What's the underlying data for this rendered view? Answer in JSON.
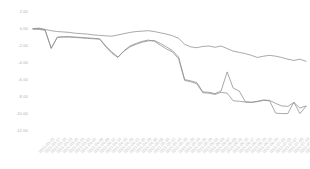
{
  "chart_data": {
    "type": "line",
    "title": "",
    "subtitle": "",
    "xlabel": "",
    "ylabel": "",
    "grid": false,
    "legend": "none",
    "line_color": "#8c8c8c",
    "tick_color": "#b8b8b8",
    "background": "#ffffff",
    "ylim": [
      -12.0,
      2.0
    ],
    "yticks": [
      2.0,
      0.0,
      -2.0,
      -4.0,
      -6.0,
      -8.0,
      -10.0,
      -12.0
    ],
    "ytick_labels": [
      "2.00",
      "0.00",
      "-2.00",
      "-4.00",
      "-6.00",
      "-8.00",
      "-10.00",
      "-12.00"
    ],
    "x": [
      "2021-03-15",
      "2021-03-17",
      "2021-03-19",
      "2021-03-23",
      "2021-03-25",
      "2021-03-29",
      "2021-03-31",
      "2021-04-02",
      "2021-04-06",
      "2021-04-08",
      "2021-04-12",
      "2021-04-14",
      "2021-04-16",
      "2021-04-20",
      "2021-04-22",
      "2021-04-26",
      "2021-04-28",
      "2021-04-30",
      "2021-05-06",
      "2021-05-10",
      "2021-05-12",
      "2021-05-14",
      "2021-05-18",
      "2021-05-20",
      "2021-05-24",
      "2021-05-26",
      "2021-05-28",
      "2021-06-01",
      "2021-06-03",
      "2021-06-07",
      "2021-06-09",
      "2021-06-11",
      "2021-06-15",
      "2021-06-17",
      "2021-06-21",
      "2021-06-23",
      "2021-06-25",
      "2021-06-29",
      "2021-07-01",
      "2021-07-05",
      "2021-07-07",
      "2021-07-09",
      "2021-07-13",
      "2021-07-15",
      "2021-07-19",
      "2021-07-21"
    ],
    "xtick_labels": [
      "2021-03-15",
      "2021-03-17",
      "2021-03-19",
      "2021-03-23",
      "2021-03-25",
      "2021-03-29",
      "2021-03-31",
      "2021-04-02",
      "2021-04-06",
      "2021-04-08",
      "2021-04-12",
      "2021-04-14",
      "2021-04-16",
      "2021-04-20",
      "2021-04-22",
      "2021-04-26",
      "2021-04-28",
      "2021-04-30",
      "2021-05-06",
      "2021-05-10",
      "2021-05-12",
      "2021-05-14",
      "2021-05-18",
      "2021-05-20",
      "2021-05-24",
      "2021-05-26",
      "2021-05-28",
      "2021-06-01",
      "2021-06-03",
      "2021-06-07",
      "2021-06-09",
      "2021-06-11",
      "2021-06-15",
      "2021-06-17",
      "2021-06-21",
      "2021-06-23",
      "2021-06-25",
      "2021-06-29",
      "2021-07-01",
      "2021-07-05",
      "2021-07-07",
      "2021-07-09",
      "2021-07-13",
      "2021-07-15",
      "2021-07-19",
      "2021-07-21"
    ],
    "series": [
      {
        "name": "series-1",
        "values": [
          0.05,
          0.1,
          -0.05,
          -0.2,
          -0.3,
          -0.35,
          -0.4,
          -0.5,
          -0.55,
          -0.6,
          -0.7,
          -0.75,
          -0.8,
          -0.85,
          -0.7,
          -0.55,
          -0.4,
          -0.3,
          -0.25,
          -0.2,
          -0.3,
          -0.45,
          -0.6,
          -0.8,
          -1.1,
          -1.8,
          -2.1,
          -2.2,
          -2.05,
          -2.0,
          -2.15,
          -2.0,
          -2.3,
          -2.6,
          -2.75,
          -2.9,
          -3.1,
          -3.35,
          -3.2,
          -3.1,
          -3.2,
          -3.35,
          -3.55,
          -3.7,
          -3.55,
          -3.8
        ]
      },
      {
        "name": "series-2",
        "values": [
          0.0,
          0.05,
          -0.1,
          -2.3,
          -0.95,
          -0.9,
          -0.9,
          -0.95,
          -1.0,
          -1.05,
          -1.1,
          -1.15,
          -2.0,
          -2.7,
          -3.3,
          -2.6,
          -2.1,
          -1.8,
          -1.55,
          -1.4,
          -1.35,
          -1.7,
          -2.1,
          -2.55,
          -3.3,
          -5.95,
          -6.1,
          -6.3,
          -7.4,
          -7.45,
          -7.6,
          -7.3,
          -5.05,
          -6.95,
          -7.3,
          -8.55,
          -8.6,
          -8.55,
          -8.4,
          -8.45,
          -9.9,
          -9.95,
          -9.95,
          -8.6,
          -9.95,
          -9.1
        ]
      },
      {
        "name": "series-3",
        "values": [
          0.0,
          -0.05,
          -0.15,
          -2.25,
          -1.0,
          -0.95,
          -0.95,
          -1.0,
          -1.05,
          -1.1,
          -1.15,
          -1.2,
          -2.1,
          -2.85,
          -3.35,
          -2.55,
          -2.0,
          -1.7,
          -1.45,
          -1.3,
          -1.45,
          -1.9,
          -2.35,
          -2.7,
          -3.5,
          -6.05,
          -6.2,
          -6.45,
          -7.5,
          -7.55,
          -7.7,
          -7.45,
          -7.55,
          -8.45,
          -8.5,
          -8.6,
          -8.65,
          -8.5,
          -8.35,
          -8.4,
          -8.75,
          -9.05,
          -9.1,
          -8.65,
          -9.3,
          -9.05
        ]
      }
    ]
  }
}
